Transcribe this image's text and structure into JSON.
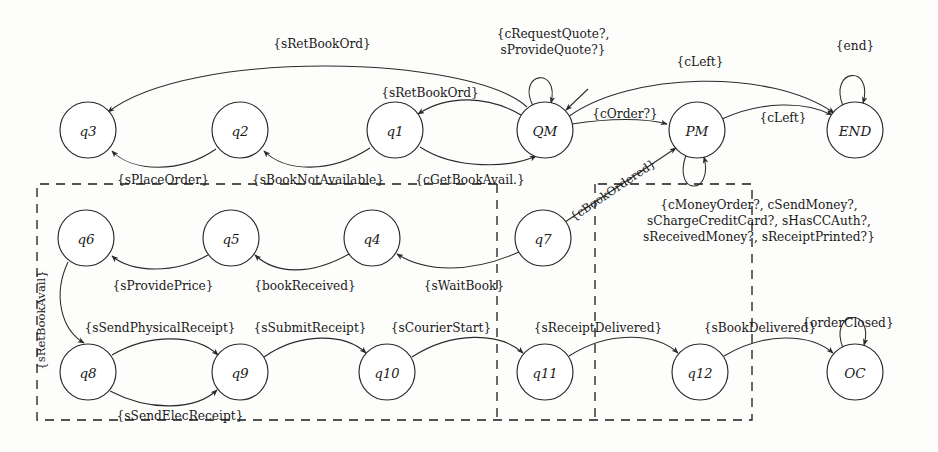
{
  "diagram": {
    "type": "state-transition-diagram",
    "stroke_color": "#2a2a2a",
    "background_color": "#fdfdfc",
    "nodes": [
      {
        "id": "q3",
        "label": "q3",
        "cx": 88,
        "cy": 130,
        "r": 28
      },
      {
        "id": "q2",
        "label": "q2",
        "cx": 240,
        "cy": 130,
        "r": 28
      },
      {
        "id": "q1",
        "label": "q1",
        "cx": 395,
        "cy": 130,
        "r": 28
      },
      {
        "id": "QM",
        "label": "QM",
        "cx": 545,
        "cy": 130,
        "r": 28
      },
      {
        "id": "PM",
        "label": "PM",
        "cx": 697,
        "cy": 130,
        "r": 28
      },
      {
        "id": "END",
        "label": "END",
        "cx": 855,
        "cy": 130,
        "r": 28
      },
      {
        "id": "q6",
        "label": "q6",
        "cx": 86,
        "cy": 238,
        "r": 28
      },
      {
        "id": "q5",
        "label": "q5",
        "cx": 231,
        "cy": 238,
        "r": 28
      },
      {
        "id": "q4",
        "label": "q4",
        "cx": 372,
        "cy": 238,
        "r": 28
      },
      {
        "id": "q7",
        "label": "q7",
        "cx": 543,
        "cy": 238,
        "r": 28
      },
      {
        "id": "q8",
        "label": "q8",
        "cx": 88,
        "cy": 372,
        "r": 28
      },
      {
        "id": "q9",
        "label": "q9",
        "cx": 240,
        "cy": 372,
        "r": 28
      },
      {
        "id": "q10",
        "label": "q10",
        "cx": 387,
        "cy": 372,
        "r": 28
      },
      {
        "id": "q11",
        "label": "q11",
        "cx": 545,
        "cy": 372,
        "r": 28
      },
      {
        "id": "q12",
        "label": "q12",
        "cx": 700,
        "cy": 372,
        "r": 28
      },
      {
        "id": "OC",
        "label": "OC",
        "cx": 855,
        "cy": 372,
        "r": 28
      }
    ],
    "edges": [
      {
        "from": "QM",
        "to": "q3",
        "label": "{sRetBookOrd}"
      },
      {
        "from": "QM",
        "to": "q1",
        "label": "{sRetBookOrd}"
      },
      {
        "from": "q1",
        "to": "QM",
        "label": "{cGetBookAvail.}"
      },
      {
        "from": "q2",
        "to": "q1",
        "label": "{sBookNotAvailable}"
      },
      {
        "from": "q3",
        "to": "q2",
        "label": "{sPlaceOrder}"
      },
      {
        "from": "QM",
        "to": "QM",
        "label": "{cRequestQuote?,\nsProvideQuote?}"
      },
      {
        "from": "QM",
        "to": "PM",
        "label": "{cOrder?}"
      },
      {
        "from": "QM",
        "to": "END",
        "label": "{cLeft}"
      },
      {
        "from": "PM",
        "to": "END",
        "label": "{cLeft}"
      },
      {
        "from": "END",
        "to": "END",
        "label": "{end}"
      },
      {
        "from": "PM",
        "to": "PM",
        "label": "{cMoneyOrder?, cSendMoney?,\nsChargeCreditCard?, sHasCCAuth?,\nsReceivedMoney?, sReceiptPrinted?}"
      },
      {
        "from": "q7",
        "to": "PM",
        "label": "{cBookOrdered}"
      },
      {
        "from": "q7",
        "to": "q4",
        "label": "{sWaitBook}"
      },
      {
        "from": "q4",
        "to": "q5",
        "label": "{bookReceived}"
      },
      {
        "from": "q5",
        "to": "q6",
        "label": "{sProvidePrice}"
      },
      {
        "from": "q6",
        "to": "q8",
        "label": "{sRetBookAvail}"
      },
      {
        "from": "q8",
        "to": "q9",
        "label": "{sSendPhysicalReceipt}"
      },
      {
        "from": "q8",
        "to": "q9",
        "label": "{sSendElecReceipt}"
      },
      {
        "from": "q9",
        "to": "q10",
        "label": "{sSubmitReceipt}"
      },
      {
        "from": "q10",
        "to": "q11",
        "label": "{sCourierStart}"
      },
      {
        "from": "q11",
        "to": "q12",
        "label": "{sReceiptDelivered}"
      },
      {
        "from": "q12",
        "to": "OC",
        "label": "{sBookDelivered}"
      },
      {
        "from": "OC",
        "to": "OC",
        "label": "{orderClosed}"
      }
    ],
    "labels": {
      "sRetBookOrd_top": "{sRetBookOrd}",
      "sRetBookOrd_mid": "{sRetBookOrd}",
      "cRequestQuote_line1": "{cRequestQuote?,",
      "cRequestQuote_line2": "sProvideQuote?}",
      "cLeft_upper": "{cLeft}",
      "cLeft_lower": "{cLeft}",
      "end_self": "{end}",
      "cOrder": "{cOrder?}",
      "cBookOrdered": "{cBookOrdered}",
      "sPlaceOrder": "{sPlaceOrder}",
      "sBookNotAvailable": "{sBookNotAvailable}",
      "cGetBookAvail": "{cGetBookAvail.}",
      "money_line1": "{cMoneyOrder?, cSendMoney?,",
      "money_line2": "sChargeCreditCard?, sHasCCAuth?,",
      "money_line3": "sReceivedMoney?, sReceiptPrinted?}",
      "sProvidePrice": "{sProvidePrice}",
      "bookReceived": "{bookReceived}",
      "sWaitBook": "{sWaitBook}",
      "sRetBookAvail_vertical": "{sRetBookAvail}",
      "sSendPhysicalReceipt": "{sSendPhysicalReceipt}",
      "sSubmitReceipt": "{sSubmitReceipt}",
      "sCourierStart": "{sCourierStart}",
      "sReceiptDelivered": "{sReceiptDelivered}",
      "sBookDelivered": "{sBookDelivered}",
      "sSendElecReceipt": "{sSendElecReceipt}",
      "orderClosed": "{orderClosed}"
    },
    "dashed_regions": [
      {
        "name": "outer-region",
        "x": 37,
        "y": 183,
        "width": 715,
        "height": 237
      },
      {
        "name": "inner-divider",
        "x": 497,
        "y": 183,
        "width": 98,
        "height": 237
      }
    ]
  }
}
